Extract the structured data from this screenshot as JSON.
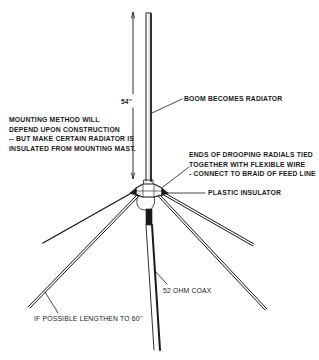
{
  "diagram": {
    "type": "ground-plane antenna construction diagram",
    "labels": {
      "boom_length": "54''",
      "mounting_note": [
        "MOUNTING METHOD WILL",
        "DEPEND UPON CONSTRUCTION",
        "-- BUT MAKE CERTAIN RADIATOR IS",
        "INSULATED FROM MOUNTING MAST."
      ],
      "boom": "BOOM BECOMES RADIATOR",
      "radial_ends_note": [
        "ENDS OF DROOPING RADIALS TIED",
        "TOGETHER WITH FLEXIBLE WIRE",
        "- CONNECT TO BRAID OF FEED LINE"
      ],
      "insulator": "PLASTIC INSULATOR",
      "coax": "52 OHM COAX",
      "radial_length_note": "IF POSSIBLE LENGTHEN TO 60''"
    },
    "components": [
      "boom-radiator",
      "plastic-insulator-hub",
      "drooping-radials",
      "coax-feed-line"
    ],
    "colors": {
      "ink": "#1a1a1a",
      "background": "#ffffff"
    }
  }
}
